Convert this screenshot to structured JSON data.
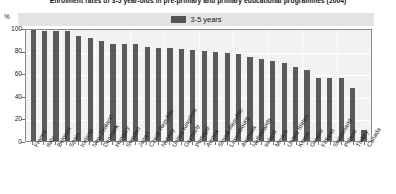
{
  "chart_data": {
    "type": "bar",
    "title": "Enrolment rates of 3-5 year-olds in pre-primary and primary educational programmes (2004)",
    "xlabel": "",
    "ylabel": "%",
    "ylim": [
      0,
      100
    ],
    "yticks": [
      0,
      20,
      40,
      60,
      80,
      100
    ],
    "grid": true,
    "legend_position": "top-center",
    "legend": [
      "3-5 years"
    ],
    "series_name": "3-5 years",
    "bar_color": "#5a5a5a",
    "categories": [
      "France",
      "Italy",
      "Belgium",
      "Spain",
      "Iceland",
      "New Zealand",
      "Denmark",
      "Hungary",
      "Sweden",
      "Japan",
      "Czech Republic",
      "Norway",
      "United Kingdom",
      "Germany",
      "Portugal",
      "Austria",
      "Slovak Republic",
      "Luxembourg",
      "Australia",
      "Netherlands",
      "Ireland",
      "Mexico",
      "United States",
      "Korea",
      "Greece",
      "Finland",
      "Switzerland",
      "Poland",
      "Turkey",
      "Canada"
    ],
    "values": [
      100,
      99,
      99,
      99,
      95,
      93,
      90,
      87,
      87,
      87,
      85,
      84,
      84,
      83,
      82,
      81,
      80,
      79,
      78,
      76,
      74,
      72,
      70,
      67,
      64,
      57,
      57,
      57,
      48,
      10
    ]
  },
  "axis": {
    "unit_label": "%"
  }
}
